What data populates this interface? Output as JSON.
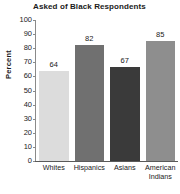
{
  "chart_data": {
    "type": "bar",
    "title": "Asked of Black Respondents",
    "xlabel": "",
    "ylabel": "Percent",
    "categories": [
      "Whites",
      "Hispanics",
      "Asians",
      "American Indians"
    ],
    "category_lines": [
      [
        "Whites"
      ],
      [
        "Hispanics"
      ],
      [
        "Asians"
      ],
      [
        "American",
        "Indians"
      ]
    ],
    "values": [
      64,
      82,
      67,
      85
    ],
    "value_labels": [
      "64",
      "82",
      "67",
      "85"
    ],
    "bar_colors": [
      "#dcdcdc",
      "#707070",
      "#3a3a3a",
      "#8e8e8e"
    ],
    "ylim": [
      0,
      100
    ],
    "ytick_step": 10,
    "ytick_labels": [
      "100",
      "90",
      "80",
      "70",
      "60",
      "50",
      "40",
      "30",
      "20",
      "10",
      "0"
    ],
    "ytick_values": [
      100,
      90,
      80,
      70,
      60,
      50,
      40,
      30,
      20,
      10,
      0
    ],
    "grid": false,
    "legend": false,
    "legend_position": "none",
    "background_color": "#ffffff",
    "axis_color": "#5a5a5a",
    "text_color": "#1a1a1a"
  }
}
